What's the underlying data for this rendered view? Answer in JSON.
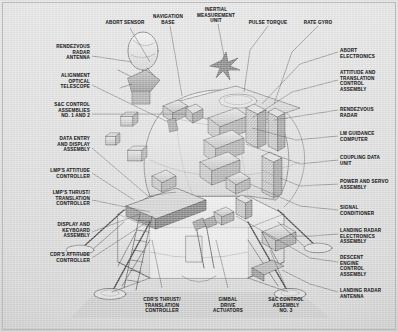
{
  "figure": {
    "style": "technical line-art cutaway illustration with callout leader lines",
    "background_color": "#dcdcdc",
    "ink_color": "#2a2a2a"
  },
  "labels": {
    "top": [
      {
        "id": "abort-sensor",
        "text": "ABORT SENSOR",
        "align": "center",
        "x": 125,
        "y": 20
      },
      {
        "id": "navigation-base",
        "text": "NAVIGATION\nBASE",
        "align": "center",
        "x": 168,
        "y": 14
      },
      {
        "id": "inertial-measurement-unit",
        "text": "INERTIAL\nMEASUREMENT\nUNIT",
        "align": "center",
        "x": 216,
        "y": 7
      },
      {
        "id": "pulse-torque",
        "text": "PULSE TORQUE",
        "align": "center",
        "x": 268,
        "y": 20
      },
      {
        "id": "rate-gyro",
        "text": "RATE GYRO",
        "align": "center",
        "x": 318,
        "y": 20
      }
    ],
    "left": [
      {
        "id": "rendezvous-radar-antenna",
        "text": "RENDEZVOUS\nRADAR\nANTENNA",
        "align": "right",
        "x": 90,
        "y": 44
      },
      {
        "id": "alignment-optical-telescope",
        "text": "ALIGNMENT\nOPTICAL\nTELESCOPE",
        "align": "right",
        "x": 90,
        "y": 73
      },
      {
        "id": "sc-control-assemblies",
        "text": "S&C CONTROL\nASSEMBLIES\nNO. 1 AND 2",
        "align": "right",
        "x": 90,
        "y": 102
      },
      {
        "id": "data-entry-display-assembly",
        "text": "DATA ENTRY\nAND DISPLAY\nASSEMBLY",
        "align": "right",
        "x": 90,
        "y": 136
      },
      {
        "id": "lmps-attitude-controller",
        "text": "LMP'S ATTITUDE\nCONTROLLER",
        "align": "right",
        "x": 90,
        "y": 168
      },
      {
        "id": "lmps-thrust-translation-controller",
        "text": "LMP'S THRUST/\nTRANSLATION\nCONTROLLER",
        "align": "right",
        "x": 90,
        "y": 190
      },
      {
        "id": "display-keyboard-assembly",
        "text": "DISPLAY AND\nKEYBOARD\nASSEMBLY",
        "align": "right",
        "x": 90,
        "y": 222
      },
      {
        "id": "cdrs-attitude-controller",
        "text": "CDR'S ATTITUDE\nCONTROLLER",
        "align": "right",
        "x": 90,
        "y": 252
      }
    ],
    "right": [
      {
        "id": "abort-electronics",
        "text": "ABORT\nELECTRONICS",
        "align": "left",
        "x": 340,
        "y": 48
      },
      {
        "id": "attitude-translation-control-assembly",
        "text": "ATTITUDE AND\nTRANSLATION\nCONTROL\nASSEMBLY",
        "align": "left",
        "x": 340,
        "y": 70
      },
      {
        "id": "rendezvous-radar",
        "text": "RENDEZVOUS\nRADAR",
        "align": "left",
        "x": 340,
        "y": 107
      },
      {
        "id": "lm-guidance-computer",
        "text": "LM GUIDANCE\nCOMPUTER",
        "align": "left",
        "x": 340,
        "y": 131
      },
      {
        "id": "coupling-data-unit",
        "text": "COUPLING DATA\nUNIT",
        "align": "left",
        "x": 340,
        "y": 155
      },
      {
        "id": "power-servo-assembly",
        "text": "POWER AND SERVO\nASSEMBLY",
        "align": "left",
        "x": 340,
        "y": 179
      },
      {
        "id": "signal-conditioner",
        "text": "SIGNAL\nCONDITIONER",
        "align": "left",
        "x": 340,
        "y": 205
      },
      {
        "id": "landing-radar-electronics-assembly",
        "text": "LANDING RADAR\nELECTRONICS\nASSEMBLY",
        "align": "left",
        "x": 340,
        "y": 228
      },
      {
        "id": "descent-engine-control-assembly",
        "text": "DESCENT\nENGINE\nCONTROL\nASSEMBLY",
        "align": "left",
        "x": 340,
        "y": 255
      },
      {
        "id": "landing-radar-antenna",
        "text": "LANDING RADAR\nANTENNA",
        "align": "left",
        "x": 340,
        "y": 288
      }
    ],
    "bottom": [
      {
        "id": "cdrs-thrust-translation-controller",
        "text": "CDR'S THRUST/\nTRANSLATION\nCONTROLLER",
        "align": "center",
        "x": 162,
        "y": 297
      },
      {
        "id": "gimbal-drive-actuators",
        "text": "GIMBAL\nDRIVE\nACTUATORS",
        "align": "center",
        "x": 228,
        "y": 297
      },
      {
        "id": "sc-control-assembly-no3",
        "text": "S&C CONTROL\nASSEMBLY\nNO. 3",
        "align": "center",
        "x": 286,
        "y": 297
      }
    ]
  }
}
